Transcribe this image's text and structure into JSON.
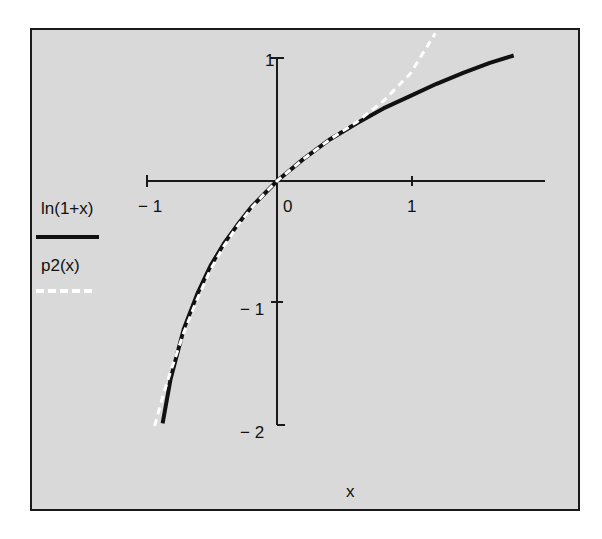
{
  "chart_data": {
    "type": "line",
    "title": "",
    "xlabel": "x",
    "ylabel": "",
    "xlim": [
      -1,
      2
    ],
    "ylim": [
      -2,
      1
    ],
    "grid": false,
    "legend_position": "left",
    "x_ticks": [
      {
        "value": -1,
        "label": "− 1"
      },
      {
        "value": 0,
        "label": "0"
      },
      {
        "value": 1,
        "label": "1"
      }
    ],
    "y_ticks": [
      {
        "value": 1,
        "label": "1"
      },
      {
        "value": -1,
        "label": "− 1"
      },
      {
        "value": -2,
        "label": "− 2"
      }
    ],
    "series": [
      {
        "name": "ln(1+x)",
        "style": "solid",
        "color": "#111111",
        "x": [
          -0.86,
          -0.8,
          -0.7,
          -0.6,
          -0.5,
          -0.4,
          -0.3,
          -0.2,
          -0.1,
          0,
          0.2,
          0.4,
          0.6,
          0.8,
          1.0,
          1.2,
          1.4,
          1.6,
          1.78
        ],
        "y": [
          -1.97,
          -1.61,
          -1.2,
          -0.92,
          -0.69,
          -0.51,
          -0.36,
          -0.22,
          -0.11,
          0,
          0.18,
          0.34,
          0.47,
          0.59,
          0.69,
          0.79,
          0.88,
          0.96,
          1.02
        ]
      },
      {
        "name": "p2(x)",
        "style": "dashed",
        "color": "#ffffff",
        "x": [
          -0.92,
          -0.85,
          -0.8,
          -0.7,
          -0.6,
          -0.5,
          -0.4,
          -0.3,
          -0.2,
          -0.1,
          0,
          0.2,
          0.4,
          0.6,
          0.8,
          1.0,
          1.19
        ],
        "y": [
          -1.99,
          -1.72,
          -1.55,
          -1.23,
          -0.96,
          -0.72,
          -0.53,
          -0.37,
          -0.23,
          -0.11,
          0,
          0.18,
          0.34,
          0.48,
          0.65,
          0.87,
          1.2
        ]
      }
    ]
  },
  "axis": {
    "x_label": "x",
    "x_tick_labels": [
      "− 1",
      "0",
      "1"
    ],
    "y_tick_labels": [
      "1",
      "− 1",
      "− 2"
    ]
  },
  "legend": {
    "items": [
      {
        "label": "ln(1+x)",
        "color": "#111111"
      },
      {
        "label": "p2(x)",
        "color": "#ffffff"
      }
    ]
  },
  "colors": {
    "plot_bg": "#d9d9d9",
    "frame": "#1a1a1a",
    "axis": "#1a1a1a"
  }
}
